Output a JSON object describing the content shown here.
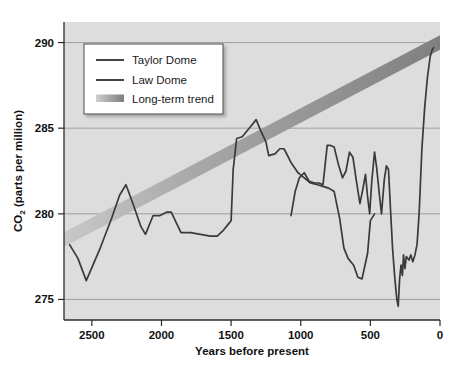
{
  "chart_data": {
    "type": "line",
    "title": "",
    "subtitle": "",
    "xlabel": "Years before present",
    "ylabel": "CO2 (parts per million)",
    "ylabel_main": "CO",
    "ylabel_sub": "2",
    "ylabel_rest": " (parts per million)",
    "xlim": [
      2700,
      0
    ],
    "ylim": [
      273.8,
      291.2
    ],
    "x_reversed": true,
    "grid": true,
    "grid_axis": "y",
    "legend_position": "top-left",
    "xticks": [
      2500,
      2000,
      1500,
      1000,
      500,
      0
    ],
    "xtick_labels": [
      "2500",
      "2000",
      "1500",
      "1000",
      "500",
      "0"
    ],
    "yticks": [
      275,
      280,
      285,
      290
    ],
    "ytick_labels": [
      "275",
      "280",
      "285",
      "290"
    ],
    "legend": [
      {
        "label": "Taylor Dome",
        "kind": "line",
        "color": "#3a3a3a"
      },
      {
        "label": "Law Dome",
        "kind": "line",
        "color": "#3a3a3a"
      },
      {
        "label": "Long-term trend",
        "kind": "band",
        "color": "#8c8c8c"
      }
    ],
    "colors": {
      "plot_background": "#dddddd",
      "grid": "#9a9a9a",
      "axis": "#2a2a2a",
      "taylor_dome": "#3a3a3a",
      "law_dome": "#3a3a3a",
      "trend_band_start": "#c8c8c8",
      "trend_band_end": "#808080",
      "legend_background": "#ffffff",
      "legend_border": "#555555",
      "text": "#111111"
    },
    "series": [
      {
        "name": "Taylor Dome",
        "points": [
          [
            2660,
            278.2
          ],
          [
            2600,
            277.4
          ],
          [
            2540,
            276.1
          ],
          [
            2440,
            278.0
          ],
          [
            2360,
            279.7
          ],
          [
            2300,
            281.1
          ],
          [
            2255,
            281.7
          ],
          [
            2205,
            280.6
          ],
          [
            2150,
            279.3
          ],
          [
            2115,
            278.8
          ],
          [
            2060,
            279.9
          ],
          [
            2010,
            279.9
          ],
          [
            1960,
            280.1
          ],
          [
            1930,
            280.1
          ],
          [
            1895,
            279.5
          ],
          [
            1860,
            278.9
          ],
          [
            1790,
            278.9
          ],
          [
            1720,
            278.8
          ],
          [
            1650,
            278.7
          ],
          [
            1600,
            278.7
          ],
          [
            1560,
            279.0
          ],
          [
            1520,
            279.4
          ],
          [
            1500,
            279.6
          ],
          [
            1485,
            282.6
          ],
          [
            1460,
            284.4
          ],
          [
            1420,
            284.5
          ],
          [
            1370,
            285.0
          ],
          [
            1320,
            285.5
          ],
          [
            1290,
            284.9
          ],
          [
            1250,
            284.2
          ],
          [
            1230,
            283.4
          ],
          [
            1185,
            283.5
          ],
          [
            1150,
            283.8
          ],
          [
            1120,
            283.8
          ],
          [
            1070,
            283.0
          ],
          [
            1020,
            282.4
          ],
          [
            975,
            282.1
          ],
          [
            930,
            281.8
          ],
          [
            880,
            281.7
          ],
          [
            840,
            281.6
          ],
          [
            800,
            281.5
          ],
          [
            760,
            281.3
          ],
          [
            720,
            279.7
          ],
          [
            690,
            278.0
          ],
          [
            660,
            277.4
          ],
          [
            620,
            277.0
          ],
          [
            590,
            276.3
          ],
          [
            560,
            276.2
          ],
          [
            520,
            277.7
          ],
          [
            500,
            279.6
          ],
          [
            470,
            280.0
          ]
        ]
      },
      {
        "name": "Law Dome",
        "points": [
          [
            1070,
            279.9
          ],
          [
            1040,
            281.3
          ],
          [
            1010,
            282.1
          ],
          [
            975,
            282.4
          ],
          [
            940,
            281.9
          ],
          [
            900,
            281.8
          ],
          [
            870,
            281.8
          ],
          [
            840,
            281.7
          ],
          [
            810,
            284.0
          ],
          [
            790,
            284.0
          ],
          [
            760,
            283.9
          ],
          [
            730,
            282.9
          ],
          [
            700,
            282.1
          ],
          [
            675,
            282.5
          ],
          [
            650,
            283.6
          ],
          [
            625,
            283.3
          ],
          [
            600,
            281.9
          ],
          [
            575,
            280.6
          ],
          [
            555,
            281.4
          ],
          [
            535,
            282.3
          ],
          [
            520,
            281.0
          ],
          [
            505,
            280.0
          ],
          [
            490,
            281.9
          ],
          [
            470,
            283.6
          ],
          [
            455,
            282.7
          ],
          [
            435,
            281.1
          ],
          [
            420,
            280.0
          ],
          [
            400,
            282.0
          ],
          [
            385,
            282.8
          ],
          [
            370,
            282.6
          ],
          [
            355,
            280.2
          ],
          [
            340,
            277.9
          ],
          [
            325,
            276.3
          ],
          [
            310,
            275.0
          ],
          [
            300,
            274.6
          ],
          [
            290,
            276.2
          ],
          [
            280,
            277.0
          ],
          [
            270,
            276.4
          ],
          [
            262,
            277.6
          ],
          [
            252,
            276.8
          ],
          [
            242,
            277.5
          ],
          [
            232,
            277.4
          ],
          [
            222,
            277.3
          ],
          [
            210,
            277.6
          ],
          [
            195,
            277.2
          ],
          [
            180,
            277.6
          ],
          [
            165,
            278.2
          ],
          [
            150,
            280.0
          ],
          [
            130,
            283.8
          ],
          [
            110,
            286.2
          ],
          [
            90,
            288.0
          ],
          [
            70,
            289.2
          ],
          [
            55,
            289.6
          ],
          [
            45,
            289.7
          ]
        ]
      }
    ],
    "trend_band": {
      "label": "Long-term trend",
      "x_start": 2700,
      "y_start": 278.5,
      "x_end": 0,
      "y_end": 290.0,
      "thickness_ppm": 0.75
    }
  },
  "plot_geometry": {
    "left": 64,
    "right": 440,
    "top": 22,
    "bottom": 320
  }
}
